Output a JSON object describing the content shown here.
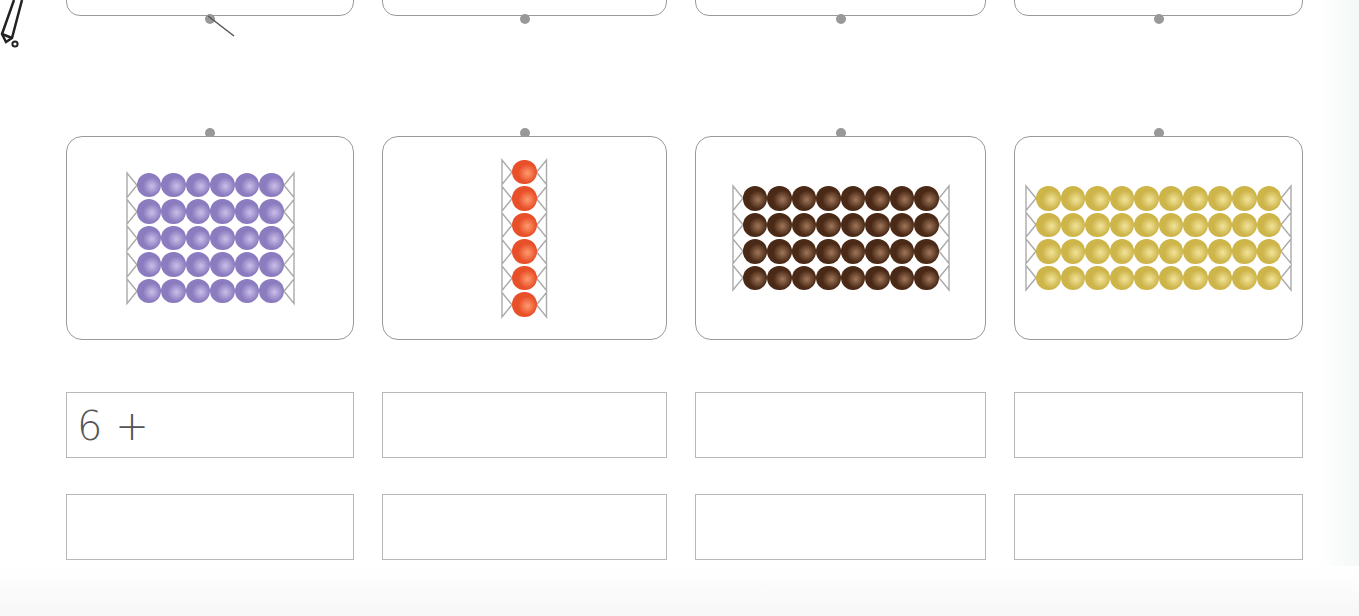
{
  "worksheet": {
    "top_cards": [
      {
        "x": 66,
        "w": 288
      },
      {
        "x": 382,
        "w": 285
      },
      {
        "x": 695,
        "w": 291
      },
      {
        "x": 1014,
        "w": 289
      }
    ],
    "bead_cards": [
      {
        "id": "purple",
        "x": 66,
        "w": 288,
        "color": "#8b7bbf",
        "highlight": "#c9bfe8",
        "cols": 6,
        "rows": 5,
        "beads_total": 30
      },
      {
        "id": "red",
        "x": 382,
        "w": 285,
        "color": "#e8502a",
        "highlight": "#ff9b6e",
        "cols": 1,
        "rows": 6,
        "beads_total": 6
      },
      {
        "id": "brown",
        "x": 695,
        "w": 291,
        "color": "#4a2a16",
        "highlight": "#a0765a",
        "cols": 8,
        "rows": 4,
        "beads_total": 32
      },
      {
        "id": "gold",
        "x": 1014,
        "w": 289,
        "color": "#cdb54a",
        "highlight": "#f2e39a",
        "cols": 10,
        "rows": 4,
        "beads_total": 40
      }
    ],
    "answer_rows": [
      {
        "y": 392,
        "boxes": [
          {
            "x": 66,
            "w": 288,
            "value": "6 +"
          },
          {
            "x": 382,
            "w": 285,
            "value": ""
          },
          {
            "x": 695,
            "w": 291,
            "value": ""
          },
          {
            "x": 1014,
            "w": 289,
            "value": ""
          }
        ]
      },
      {
        "y": 494,
        "boxes": [
          {
            "x": 66,
            "w": 288,
            "value": ""
          },
          {
            "x": 382,
            "w": 285,
            "value": ""
          },
          {
            "x": 695,
            "w": 291,
            "value": ""
          },
          {
            "x": 1014,
            "w": 289,
            "value": ""
          }
        ]
      }
    ],
    "icons": {
      "pencil": "pencil-icon"
    },
    "colors": {
      "border": "#9a9a9a",
      "box_border": "#b8b8b8",
      "text": "#555555"
    }
  }
}
